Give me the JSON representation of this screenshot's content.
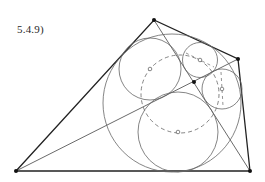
{
  "figure": {
    "label": "5.4.9)",
    "colors": {
      "stroke_main": "#222222",
      "stroke_circle": "#6a6a6a",
      "background": "#ffffff"
    },
    "quadrilateral": {
      "vertices": [
        {
          "name": "A",
          "x": 16,
          "y": 171
        },
        {
          "name": "B",
          "x": 154,
          "y": 20
        },
        {
          "name": "C",
          "x": 238,
          "y": 59
        },
        {
          "name": "D",
          "x": 250,
          "y": 171
        }
      ],
      "diagonal_intersection": {
        "x": 194,
        "y": 82
      }
    },
    "circles": {
      "incircle": {
        "cx": 172,
        "cy": 103,
        "r": 69
      },
      "circle_top_left": {
        "cx": 150,
        "cy": 69,
        "r": 31
      },
      "circle_top_right": {
        "cx": 200,
        "cy": 60,
        "r": 17.5
      },
      "circle_right": {
        "cx": 222,
        "cy": 89,
        "r": 20
      },
      "circle_bottom": {
        "cx": 178,
        "cy": 132,
        "r": 40
      },
      "dashed_circle": {
        "cx": 180,
        "cy": 94,
        "r": 39
      }
    }
  }
}
